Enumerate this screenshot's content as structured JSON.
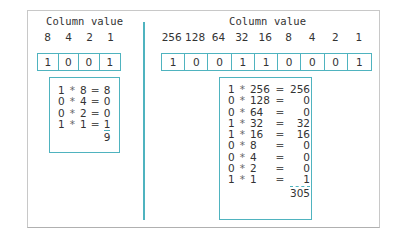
{
  "left": {
    "title": "Column value",
    "column_values": [
      "8",
      "4",
      "2",
      "1"
    ],
    "bits": [
      "1",
      "0",
      "0",
      "1"
    ],
    "calc_rows": [
      {
        "bit": "1",
        "op": "*",
        "col": "8",
        "eq": "=",
        "result": "8"
      },
      {
        "bit": "0",
        "op": "*",
        "col": "4",
        "eq": "=",
        "result": "0"
      },
      {
        "bit": "0",
        "op": "*",
        "col": "2",
        "eq": "=",
        "result": "0"
      },
      {
        "bit": "1",
        "op": "*",
        "col": "1",
        "eq": "=",
        "result": "1"
      }
    ],
    "total": "9"
  },
  "right": {
    "title": "Column value",
    "column_values": [
      "256",
      "128",
      "64",
      "32",
      "16",
      "8",
      "4",
      "2",
      "1"
    ],
    "bits": [
      "1",
      "0",
      "0",
      "1",
      "1",
      "0",
      "0",
      "0",
      "1"
    ],
    "calc_rows": [
      {
        "bit": "1",
        "op": "*",
        "col": "256",
        "eq": "=",
        "result": "256"
      },
      {
        "bit": "0",
        "op": "*",
        "col": "128",
        "eq": "=",
        "result": "0"
      },
      {
        "bit": "0",
        "op": "*",
        "col": "64",
        "eq": "=",
        "result": "0"
      },
      {
        "bit": "1",
        "op": "*",
        "col": "32",
        "eq": "=",
        "result": "32"
      },
      {
        "bit": "1",
        "op": "*",
        "col": "16",
        "eq": "=",
        "result": "16"
      },
      {
        "bit": "0",
        "op": "*",
        "col": "8",
        "eq": "=",
        "result": "0"
      },
      {
        "bit": "0",
        "op": "*",
        "col": "4",
        "eq": "=",
        "result": "0"
      },
      {
        "bit": "0",
        "op": "*",
        "col": "2",
        "eq": "=",
        "result": "0"
      },
      {
        "bit": "1",
        "op": "*",
        "col": "1",
        "eq": "=",
        "result": "1"
      }
    ],
    "total": "305"
  },
  "colors": {
    "accent": "#4fb3bf",
    "frame": "#c8c8c8",
    "text": "#333333"
  }
}
